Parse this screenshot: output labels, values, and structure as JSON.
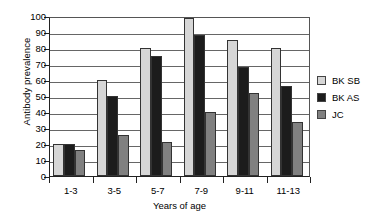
{
  "chart_data": {
    "type": "bar",
    "title": "",
    "xlabel": "Years of age",
    "ylabel": "Antibody prevalence",
    "categories": [
      "1-3",
      "3-5",
      "5-7",
      "7-9",
      "9-11",
      "11-13"
    ],
    "series": [
      {
        "name": "BK SB",
        "color": "#d6d6d6",
        "values": [
          20,
          60,
          80,
          99,
          85,
          80
        ]
      },
      {
        "name": "BK AS",
        "color": "#1c1c1c",
        "values": [
          20,
          50,
          75,
          88,
          68,
          56
        ]
      },
      {
        "name": "JC",
        "color": "#808080",
        "values": [
          16.5,
          25.5,
          21,
          40,
          52,
          34
        ]
      }
    ],
    "ylim": [
      0,
      100
    ],
    "yticks": [
      0,
      10,
      20,
      30,
      40,
      50,
      60,
      70,
      80,
      90,
      100
    ],
    "ytick_labels": [
      "0",
      "10",
      "20",
      "30",
      "40",
      "50",
      "60",
      "70",
      "80",
      "90",
      "100"
    ],
    "grid": true,
    "grid_axis": "y",
    "legend_position": "right"
  },
  "legend": {
    "items": [
      {
        "label": "BK SB",
        "color": "#d6d6d6"
      },
      {
        "label": "BK AS",
        "color": "#1c1c1c"
      },
      {
        "label": "JC",
        "color": "#808080"
      }
    ]
  }
}
